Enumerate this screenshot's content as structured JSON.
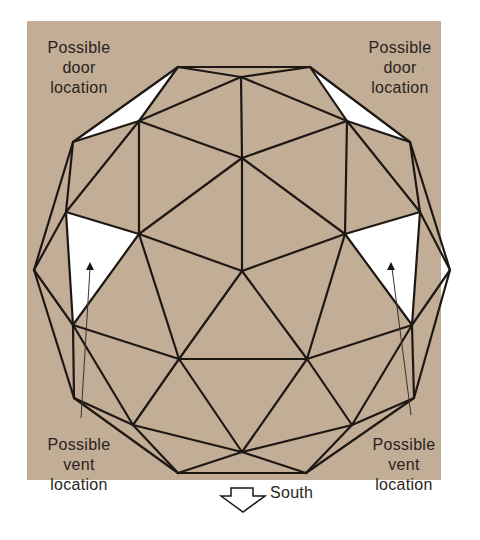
{
  "figure": {
    "background_color": "#c2ad96",
    "line_color": "#1e1814",
    "highlight_color": "#ffffff",
    "labels": {
      "door_left": [
        "Possible",
        "door",
        "location"
      ],
      "door_right": [
        "Possible",
        "door",
        "location"
      ],
      "vent_left": [
        "Possible",
        "vent",
        "location"
      ],
      "vent_right": [
        "Possible",
        "vent",
        "location"
      ],
      "direction": "South"
    },
    "icons": {
      "direction_arrow": "down-arrow-icon",
      "vent_pointer_left": "up-arrow-icon",
      "vent_pointer_right": "up-arrow-icon"
    }
  }
}
